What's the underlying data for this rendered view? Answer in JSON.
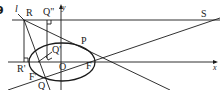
{
  "figure": {
    "number": "9",
    "labels": {
      "directrix": "l",
      "R": "R",
      "Q_double_prime": "Q\"",
      "y_axis": "y",
      "S": "S",
      "P": "P",
      "Q_prime": "Q'",
      "R_prime": "R'",
      "O": "O",
      "F": "F",
      "F_prime": "F'",
      "Q": "Q",
      "x_axis": "x"
    },
    "colors": {
      "stroke": "#1a1a1a",
      "background": "#ffffff"
    }
  }
}
